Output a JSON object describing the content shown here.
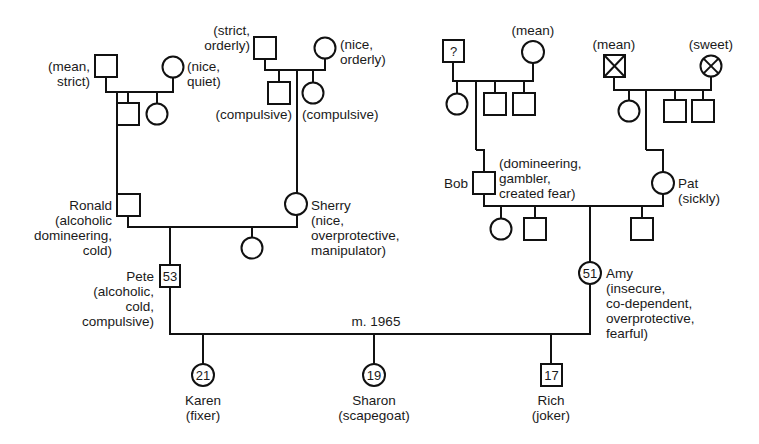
{
  "diagram": {
    "type": "genogram",
    "marriage_label": "m. 1965",
    "people": {
      "pete_father_gf": {
        "label": "(mean,",
        "label2": "strict)"
      },
      "pete_father_gm": {
        "label": "(nice,",
        "label2": "quiet)"
      },
      "pete_mother_gf": {
        "label": "(strict,",
        "label2": "orderly)"
      },
      "pete_mother_gm": {
        "label": "(nice,",
        "label2": "orderly)"
      },
      "sherry_sib1": {
        "label": "(compulsive)"
      },
      "sherry_sib2": {
        "label": "(compulsive)"
      },
      "amy_father_gf": {
        "label": "?"
      },
      "amy_father_gm": {
        "label": "(mean)"
      },
      "amy_mother_gf": {
        "label": "(mean)"
      },
      "amy_mother_gm": {
        "label": "(sweet)"
      },
      "ronald": {
        "name": "Ronald",
        "traits": [
          "(alcoholic",
          "domineering,",
          "cold)"
        ]
      },
      "sherry": {
        "name": "Sherry",
        "traits": [
          "(nice,",
          "overprotective,",
          "manipulator)"
        ]
      },
      "bob": {
        "name": "Bob",
        "traits": [
          "(domineering,",
          "gambler,",
          "created fear)"
        ]
      },
      "pat": {
        "name": "Pat",
        "traits": [
          "(sickly)"
        ]
      },
      "pete": {
        "name": "Pete",
        "age": "53",
        "traits": [
          "(alcoholic,",
          "cold,",
          "compulsive)"
        ]
      },
      "amy": {
        "name": "Amy",
        "age": "51",
        "traits": [
          "(insecure,",
          "co-dependent,",
          "overprotective,",
          "fearful)"
        ]
      },
      "karen": {
        "name": "Karen",
        "age": "21",
        "role": "(fixer)"
      },
      "sharon": {
        "name": "Sharon",
        "age": "19",
        "role": "(scapegoat)"
      },
      "rich": {
        "name": "Rich",
        "age": "17",
        "role": "(joker)"
      }
    }
  }
}
